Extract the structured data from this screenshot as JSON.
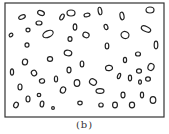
{
  "figure": {
    "caption": "(b)",
    "frame": {
      "x": 5,
      "y": 3,
      "width": 159,
      "height": 114,
      "stroke": "#333333"
    },
    "particle_stroke": "#222222",
    "particles": [
      [
        22,
        17,
        3.5,
        2,
        -25
      ],
      [
        41,
        13,
        3.5,
        2.3,
        20
      ],
      [
        39,
        23,
        3,
        2,
        0
      ],
      [
        62,
        17,
        1.8,
        3.2,
        30
      ],
      [
        71,
        13,
        4,
        3,
        0
      ],
      [
        87,
        15,
        3,
        1.8,
        -10
      ],
      [
        100,
        11,
        1.8,
        3.8,
        -10
      ],
      [
        122,
        16,
        2,
        3.8,
        -10
      ],
      [
        150,
        10,
        4,
        3,
        0
      ],
      [
        11,
        35,
        2,
        1.6,
        -40
      ],
      [
        28,
        30,
        2,
        1.8,
        0
      ],
      [
        48,
        34,
        5.5,
        3.2,
        -25
      ],
      [
        75,
        27,
        1.8,
        3.2,
        0
      ],
      [
        86,
        35,
        3.2,
        2.6,
        20
      ],
      [
        106,
        27,
        1.8,
        2.6,
        -20
      ],
      [
        125,
        35,
        4,
        3.5,
        20
      ],
      [
        146,
        29,
        5,
        2.5,
        25
      ],
      [
        27,
        45,
        2,
        2.2,
        0
      ],
      [
        70,
        39,
        2,
        2.4,
        0
      ],
      [
        107,
        46,
        1.8,
        3,
        0
      ],
      [
        156,
        45,
        1.8,
        3.8,
        0
      ],
      [
        68,
        53,
        3.8,
        2.8,
        10
      ],
      [
        138,
        54,
        2.5,
        2,
        0
      ],
      [
        25,
        62,
        2.6,
        3,
        10
      ],
      [
        50,
        59,
        2.6,
        2.4,
        0
      ],
      [
        82,
        64,
        1.8,
        3,
        0
      ],
      [
        125,
        60,
        1.6,
        2.6,
        0
      ],
      [
        151,
        67,
        3,
        3.5,
        20
      ],
      [
        12,
        72,
        1.6,
        3.2,
        0
      ],
      [
        34,
        73,
        2.6,
        2.8,
        -30
      ],
      [
        69,
        70,
        2,
        2.8,
        0
      ],
      [
        109,
        68,
        3.5,
        2.6,
        -10
      ],
      [
        139,
        71,
        2.5,
        2.2,
        0
      ],
      [
        42,
        81,
        2.6,
        2.2,
        -10
      ],
      [
        56,
        79,
        1.6,
        3,
        0
      ],
      [
        77,
        83,
        2.8,
        3.4,
        0
      ],
      [
        93,
        82,
        3.6,
        3,
        30
      ],
      [
        119,
        76,
        1.4,
        2.8,
        20
      ],
      [
        130,
        78,
        1.6,
        2.8,
        0
      ],
      [
        140,
        82,
        1.4,
        2.2,
        0
      ],
      [
        148,
        79,
        2.4,
        2.2,
        0
      ],
      [
        20,
        87,
        2,
        3,
        0
      ],
      [
        63,
        90,
        2.6,
        3.2,
        20
      ],
      [
        100,
        91,
        4,
        2.4,
        0
      ],
      [
        123,
        95,
        2,
        2.8,
        0
      ],
      [
        142,
        95,
        1.6,
        2.8,
        0
      ],
      [
        39,
        95,
        1.8,
        1.6,
        0
      ],
      [
        28,
        99,
        2,
        3,
        0
      ],
      [
        42,
        104,
        1.8,
        3,
        10
      ],
      [
        16,
        105,
        2.2,
        2.8,
        30
      ],
      [
        53,
        108,
        1.4,
        1.4,
        0
      ],
      [
        80,
        103,
        2.2,
        1.8,
        0
      ],
      [
        101,
        105,
        2.2,
        2,
        0
      ],
      [
        115,
        105,
        2.4,
        2.8,
        0
      ],
      [
        132,
        105,
        2.6,
        2.8,
        0
      ],
      [
        153,
        100,
        2.8,
        3.4,
        0
      ]
    ]
  }
}
